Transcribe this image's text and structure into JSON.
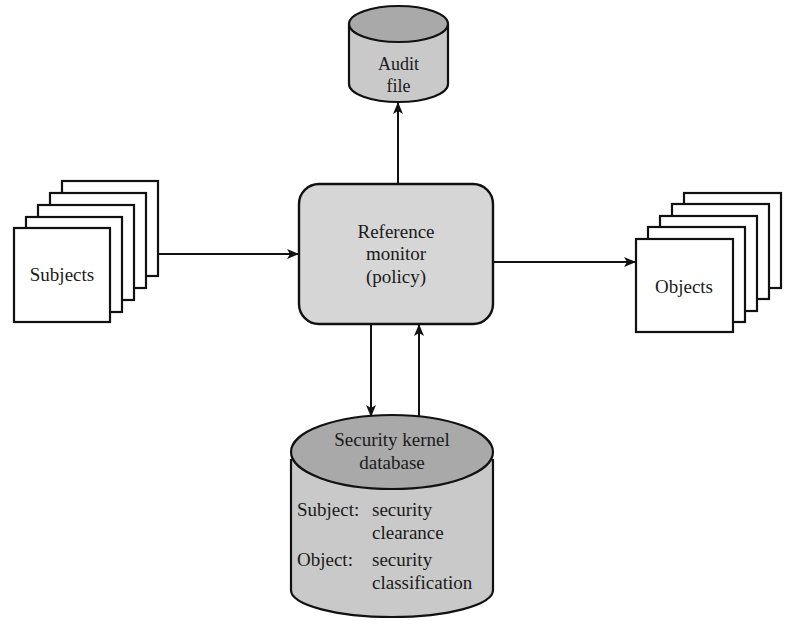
{
  "diagram": {
    "type": "reference-monitor-architecture",
    "nodes": {
      "audit_file": {
        "line1": "Audit",
        "line2": "file",
        "shape": "cylinder"
      },
      "reference_monitor": {
        "line1": "Reference",
        "line2": "monitor",
        "line3": "(policy)",
        "shape": "rounded-rectangle"
      },
      "subjects": {
        "label": "Subjects",
        "shape": "stacked-pages",
        "page_count": 5
      },
      "objects": {
        "label": "Objects",
        "shape": "stacked-pages",
        "page_count": 5
      },
      "security_kernel_db": {
        "title_line1": "Security kernel",
        "title_line2": "database",
        "shape": "cylinder",
        "entries": [
          {
            "key": "Subject:",
            "value_line1": "security",
            "value_line2": "clearance"
          },
          {
            "key": "Object:",
            "value_line1": "security",
            "value_line2": "classification"
          }
        ]
      }
    },
    "edges": [
      {
        "from": "subjects",
        "to": "reference_monitor"
      },
      {
        "from": "reference_monitor",
        "to": "objects"
      },
      {
        "from": "reference_monitor",
        "to": "audit_file"
      },
      {
        "from": "reference_monitor",
        "to": "security_kernel_db"
      },
      {
        "from": "security_kernel_db",
        "to": "reference_monitor"
      }
    ],
    "colors": {
      "stroke": "#111111",
      "monitor_fill": "#d6d6d6",
      "cylinder_body": "#c9c9c9",
      "cylinder_top": "#a9a9a9",
      "page_fill": "#ffffff"
    }
  }
}
